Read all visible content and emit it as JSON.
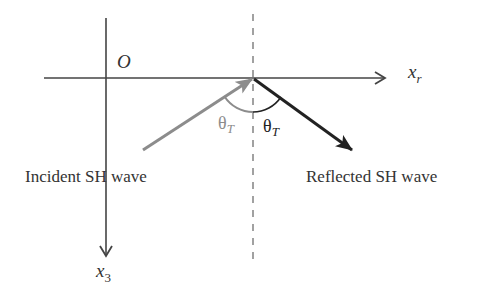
{
  "diagram": {
    "origin_label": "O",
    "axes": {
      "horizontal": {
        "label": "x",
        "subscript": "r"
      },
      "vertical": {
        "label": "x",
        "subscript": "3"
      }
    },
    "incident": {
      "label": "Incident SH wave",
      "angle_symbol": "θ",
      "angle_subscript": "T",
      "color": "#8c8c8c"
    },
    "reflected": {
      "label": "Reflected SH wave",
      "angle_symbol": "θ",
      "angle_subscript": "T",
      "color": "#222222"
    },
    "colors": {
      "axis": "#444444",
      "normal_dashed": "#8a8a8a",
      "text": "#333333"
    }
  }
}
